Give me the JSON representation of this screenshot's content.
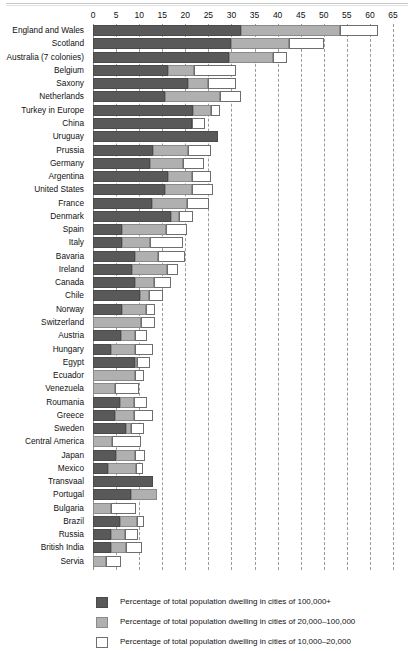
{
  "chart_data": {
    "type": "bar",
    "orientation": "horizontal",
    "stacked": true,
    "title": "",
    "xlabel": "",
    "ylabel": "",
    "xlim": [
      0,
      65
    ],
    "xticks": [
      0,
      5,
      10,
      15,
      20,
      25,
      30,
      35,
      40,
      45,
      50,
      55,
      60,
      65
    ],
    "grid": "vertical-dashed",
    "legend_position": "bottom",
    "colors": {
      "series_100k_plus": "#595959",
      "series_20k_100k": "#b0b0b0",
      "series_10k_20k": "#ffffff",
      "gridline": "#9a9a9a",
      "text": "#111111"
    },
    "series": [
      {
        "name": "Percentage of total population dwelling in cities of 100,000+"
      },
      {
        "name": "Percentage of total population dwelling in cities of 20,000–100,000"
      },
      {
        "name": "Percentage of total population dwelling in cities of 10,000–20,000"
      }
    ],
    "categories": [
      "England and Wales",
      "Scotland",
      "Australia (7 colonies)",
      "Belgium",
      "Saxony",
      "Netherlands",
      "Turkey in Europe",
      "China",
      "Uruguay",
      "Prussia",
      "Germany",
      "Argentina",
      "United States",
      "France",
      "Denmark",
      "Spain",
      "Italy",
      "Bavaria",
      "Ireland",
      "Canada",
      "Chile",
      "Norway",
      "Switzerland",
      "Austria",
      "Hungary",
      "Egypt",
      "Ecuador",
      "Venezuela",
      "Roumania",
      "Greece",
      "Sweden",
      "Central America",
      "Japan",
      "Mexico",
      "Transvaal",
      "Portugal",
      "Bulgaria",
      "Brazil",
      "Russia",
      "British India",
      "Servia"
    ],
    "rows": [
      {
        "label": "England and Wales",
        "v": [
          32.0,
          21.5,
          8.3
        ]
      },
      {
        "label": "Scotland",
        "v": [
          30.0,
          12.5,
          7.5
        ]
      },
      {
        "label": "Australia (7 colonies)",
        "v": [
          29.5,
          9.5,
          3.0
        ]
      },
      {
        "label": "Belgium",
        "v": [
          16.3,
          5.5,
          9.2
        ]
      },
      {
        "label": "Saxony",
        "v": [
          20.6,
          4.4,
          6.0
        ]
      },
      {
        "label": "Netherlands",
        "v": [
          15.6,
          12.0,
          4.4
        ]
      },
      {
        "label": "Turkey in Europe",
        "v": [
          21.7,
          3.8,
          2.0
        ]
      },
      {
        "label": "China",
        "v": [
          21.5,
          0.0,
          2.8
        ]
      },
      {
        "label": "Uruguay",
        "v": [
          27.0,
          0.0,
          0.0
        ]
      },
      {
        "label": "Prussia",
        "v": [
          13.0,
          7.5,
          5.0
        ]
      },
      {
        "label": "Germany",
        "v": [
          12.3,
          7.2,
          4.5
        ]
      },
      {
        "label": "Argentina",
        "v": [
          16.3,
          5.2,
          4.0
        ]
      },
      {
        "label": "United States",
        "v": [
          15.6,
          5.8,
          4.5
        ]
      },
      {
        "label": "France",
        "v": [
          12.8,
          7.5,
          4.8
        ]
      },
      {
        "label": "Denmark",
        "v": [
          16.8,
          1.8,
          3.0
        ]
      },
      {
        "label": "Spain",
        "v": [
          6.3,
          9.5,
          4.5
        ]
      },
      {
        "label": "Italy",
        "v": [
          6.3,
          6.0,
          7.2
        ]
      },
      {
        "label": "Bavaria",
        "v": [
          9.0,
          5.0,
          6.0
        ]
      },
      {
        "label": "Ireland",
        "v": [
          8.5,
          7.5,
          2.5
        ]
      },
      {
        "label": "Canada",
        "v": [
          9.0,
          4.3,
          3.7
        ]
      },
      {
        "label": "Chile",
        "v": [
          10.2,
          2.0,
          3.0
        ]
      },
      {
        "label": "Norway",
        "v": [
          6.3,
          5.2,
          2.0
        ]
      },
      {
        "label": "Switzerland",
        "v": [
          0.0,
          10.5,
          3.0
        ]
      },
      {
        "label": "Austria",
        "v": [
          6.0,
          3.0,
          2.8
        ]
      },
      {
        "label": "Hungary",
        "v": [
          4.0,
          5.0,
          4.0
        ]
      },
      {
        "label": "Egypt",
        "v": [
          9.0,
          0.5,
          2.8
        ]
      },
      {
        "label": "Ecuador",
        "v": [
          0.0,
          9.0,
          2.0
        ]
      },
      {
        "label": "Venezuela",
        "v": [
          0.0,
          4.8,
          5.2
        ]
      },
      {
        "label": "Roumania",
        "v": [
          5.8,
          3.0,
          2.8
        ]
      },
      {
        "label": "Greece",
        "v": [
          4.8,
          4.0,
          4.2
        ]
      },
      {
        "label": "Sweden",
        "v": [
          7.2,
          1.0,
          2.8
        ]
      },
      {
        "label": "Central America",
        "v": [
          0.0,
          4.2,
          6.3
        ]
      },
      {
        "label": "Japan",
        "v": [
          5.0,
          4.0,
          2.3
        ]
      },
      {
        "label": "Mexico",
        "v": [
          3.3,
          6.0,
          1.5
        ]
      },
      {
        "label": "Transvaal",
        "v": [
          13.0,
          0.0,
          0.0
        ]
      },
      {
        "label": "Portugal",
        "v": [
          8.3,
          5.5,
          0.0
        ]
      },
      {
        "label": "Bulgaria",
        "v": [
          0.0,
          4.0,
          5.3
        ]
      },
      {
        "label": "Brazil",
        "v": [
          5.8,
          3.8,
          1.5
        ]
      },
      {
        "label": "Russia",
        "v": [
          3.8,
          3.2,
          2.8
        ]
      },
      {
        "label": "British India",
        "v": [
          3.8,
          3.3,
          3.5
        ]
      },
      {
        "label": "Servia",
        "v": [
          0.0,
          2.8,
          3.2
        ]
      }
    ]
  },
  "legend": {
    "items": [
      {
        "swatch": "s1",
        "text": "Percentage of total population dwelling in cities of 100,000+"
      },
      {
        "swatch": "s2",
        "text": "Percentage of total population dwelling in cities of 20,000–100,000"
      },
      {
        "swatch": "s3",
        "text": "Percentage of total population dwelling in cities of 10,000–20,000"
      }
    ]
  }
}
